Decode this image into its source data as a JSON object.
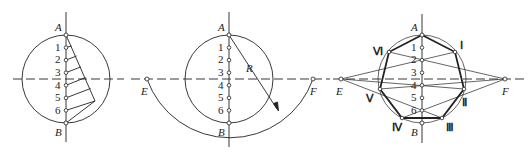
{
  "figure": {
    "panels": [
      {
        "id": "panel-1",
        "labels": {
          "top": "A",
          "bottom": "B"
        },
        "divisions": [
          "1",
          "2",
          "3",
          "4",
          "5",
          "6"
        ]
      },
      {
        "id": "panel-2",
        "labels": {
          "top": "A",
          "bottom": "B",
          "left": "E",
          "right": "F",
          "radius": "R"
        },
        "divisions": [
          "1",
          "2",
          "3",
          "4",
          "5",
          "6"
        ]
      },
      {
        "id": "panel-3",
        "labels": {
          "top": "A",
          "bottom": "B",
          "left": "E",
          "right": "F"
        },
        "divisions": [
          "1",
          "2",
          "3",
          "4",
          "5",
          "6"
        ],
        "vertices": [
          "I",
          "II",
          "III",
          "IV",
          "V",
          "VI"
        ],
        "vertex_glyphs": [
          "Ⅰ",
          "Ⅱ",
          "Ⅲ",
          "Ⅳ",
          "Ⅴ",
          "Ⅵ"
        ]
      }
    ]
  },
  "colors": {
    "stroke": "#222222",
    "background": "#ffffff"
  }
}
